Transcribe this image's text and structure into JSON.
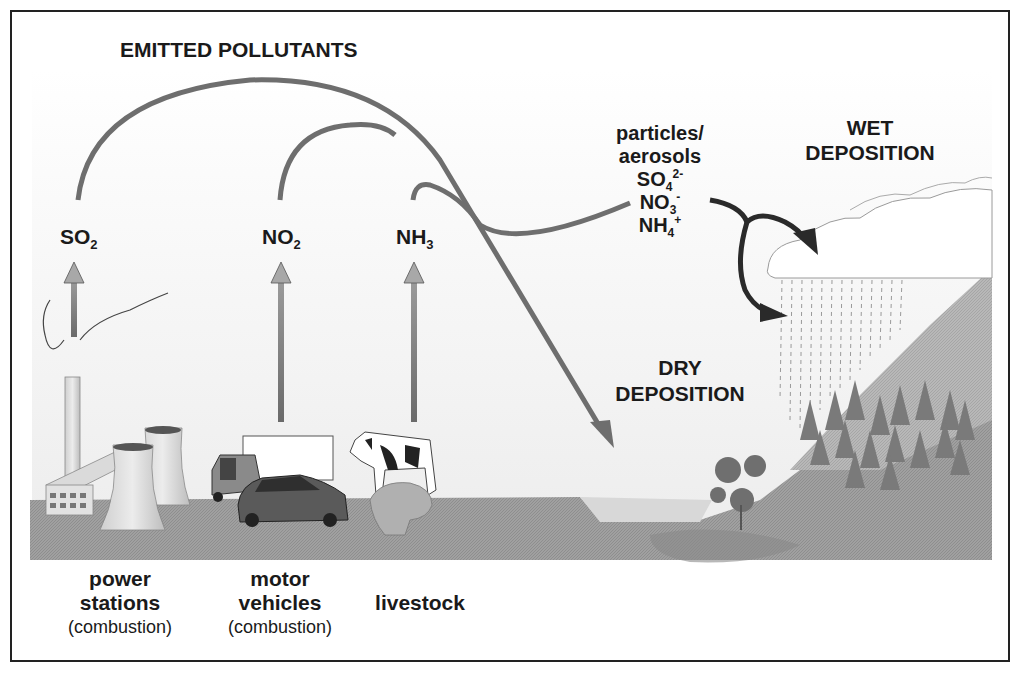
{
  "diagram": {
    "title": "EMITTED POLLUTANTS",
    "pollutants": [
      {
        "base": "SO",
        "sub": "2",
        "id": "so2"
      },
      {
        "base": "NO",
        "sub": "2",
        "id": "no2"
      },
      {
        "base": "NH",
        "sub": "3",
        "id": "nh3"
      }
    ],
    "aerosols": {
      "line1": "particles/",
      "line2": "aerosols",
      "ions": [
        {
          "base": "SO",
          "sub": "4",
          "sup": "2-"
        },
        {
          "base": "NO",
          "sub": "3",
          "sup": "-"
        },
        {
          "base": "NH",
          "sub": "4",
          "sup": "+"
        }
      ]
    },
    "wet_deposition": {
      "line1": "WET",
      "line2": "DEPOSITION"
    },
    "dry_deposition": {
      "line1": "DRY",
      "line2": "DEPOSITION"
    },
    "sources": [
      {
        "line1": "power",
        "line2": "stations",
        "line3": "(combustion)",
        "icon": "power-station-icon"
      },
      {
        "line1": "motor",
        "line2": "vehicles",
        "line3": "(combustion)",
        "icon": "vehicle-icon"
      },
      {
        "line1": "livestock",
        "line2": "",
        "line3": "",
        "icon": "livestock-icon"
      }
    ],
    "colors": {
      "frame": "#222222",
      "flow_arrow": "#6e6e6e",
      "dark_arrow": "#2a2a2a",
      "ground": "#9a9a9a",
      "sky": "#f2f2f2"
    }
  }
}
